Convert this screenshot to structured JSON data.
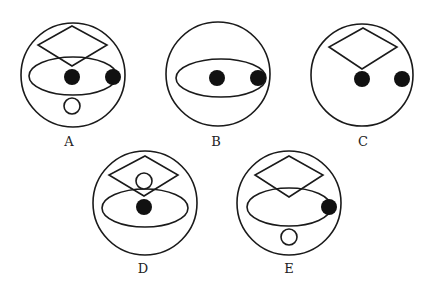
{
  "colors": {
    "stroke": "#1a1a1a",
    "fill_dot": "#111111",
    "background": "#ffffff"
  },
  "options": [
    {
      "label": "A",
      "circle": {
        "cx": 73,
        "cy": 75,
        "r": 52
      },
      "diamond": {
        "top": [
          72,
          26
        ],
        "right": [
          107,
          45
        ],
        "bottom": [
          72,
          66
        ],
        "left": [
          38,
          45
        ]
      },
      "ellipse": {
        "cx": 73,
        "cy": 76,
        "rx": 44,
        "ry": 19
      },
      "solid_dots": [
        {
          "cx": 72,
          "cy": 77,
          "r": 8
        },
        {
          "cx": 113,
          "cy": 77,
          "r": 8
        }
      ],
      "hollow_dots": [
        {
          "cx": 72,
          "cy": 106,
          "r": 8
        }
      ],
      "label_pos": [
        69,
        146
      ]
    },
    {
      "label": "B",
      "circle": {
        "cx": 218,
        "cy": 74,
        "r": 52
      },
      "diamond": null,
      "ellipse": {
        "cx": 221,
        "cy": 78,
        "rx": 45,
        "ry": 19
      },
      "solid_dots": [
        {
          "cx": 217,
          "cy": 78,
          "r": 8
        },
        {
          "cx": 258,
          "cy": 78,
          "r": 8
        }
      ],
      "hollow_dots": [],
      "label_pos": [
        216,
        146
      ]
    },
    {
      "label": "C",
      "circle": {
        "cx": 362,
        "cy": 75,
        "r": 51
      },
      "diamond": {
        "top": [
          363,
          28
        ],
        "right": [
          397,
          47
        ],
        "bottom": [
          362,
          69
        ],
        "left": [
          329,
          47
        ]
      },
      "ellipse": null,
      "solid_dots": [
        {
          "cx": 362,
          "cy": 79,
          "r": 8
        },
        {
          "cx": 402,
          "cy": 79,
          "r": 8
        }
      ],
      "hollow_dots": [],
      "label_pos": [
        363,
        146
      ]
    },
    {
      "label": "D",
      "circle": {
        "cx": 145,
        "cy": 203,
        "r": 52
      },
      "diamond": {
        "top": [
          145,
          156
        ],
        "right": [
          178,
          175
        ],
        "bottom": [
          144,
          196
        ],
        "left": [
          109,
          175
        ]
      },
      "ellipse": {
        "cx": 145,
        "cy": 208,
        "rx": 43,
        "ry": 19
      },
      "solid_dots": [
        {
          "cx": 144,
          "cy": 207,
          "r": 8
        }
      ],
      "hollow_dots": [
        {
          "cx": 144,
          "cy": 181,
          "r": 8
        }
      ],
      "label_pos": [
        143,
        273
      ]
    },
    {
      "label": "E",
      "circle": {
        "cx": 289,
        "cy": 203,
        "r": 52
      },
      "diamond": {
        "top": [
          289,
          156
        ],
        "right": [
          323,
          175
        ],
        "bottom": [
          289,
          197
        ],
        "left": [
          255,
          175
        ]
      },
      "ellipse": {
        "cx": 289,
        "cy": 207,
        "rx": 42,
        "ry": 19
      },
      "solid_dots": [
        {
          "cx": 329,
          "cy": 207,
          "r": 8
        }
      ],
      "hollow_dots": [
        {
          "cx": 289,
          "cy": 237,
          "r": 8
        }
      ],
      "label_pos": [
        289,
        273
      ]
    }
  ]
}
